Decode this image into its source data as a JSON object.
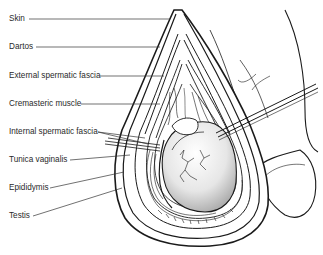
{
  "diagram": {
    "type": "anatomical-illustration",
    "labels": [
      {
        "id": "skin",
        "text": "Skin",
        "y": 19
      },
      {
        "id": "dartos",
        "text": "Dartos",
        "y": 47
      },
      {
        "id": "external-spermatic-fascia",
        "text": "External spermatic fascia",
        "y": 76
      },
      {
        "id": "cremasteric-muscle",
        "text": "Cremasteric muscle",
        "y": 104
      },
      {
        "id": "internal-spermatic-fascia",
        "text": "Internal spermatic fascia",
        "y": 132
      },
      {
        "id": "tunica-vaginalis",
        "text": "Tunica vaginalis",
        "y": 160
      },
      {
        "id": "epididymis",
        "text": "Epididymis",
        "y": 188
      },
      {
        "id": "testis",
        "text": "Testis",
        "y": 216
      }
    ],
    "colors": {
      "line": "#1a1a1a",
      "text": "#2a2a2a",
      "background": "#ffffff",
      "testis_shade": "#d9d9d9"
    }
  }
}
